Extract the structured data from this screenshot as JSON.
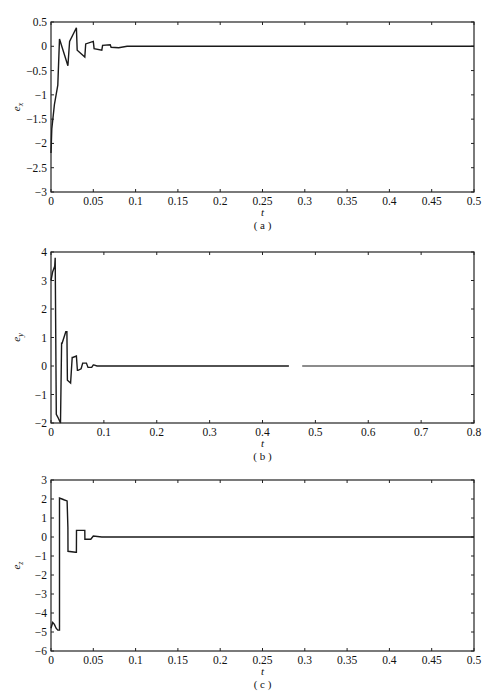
{
  "chart_data": [
    {
      "id": "a",
      "type": "line",
      "caption": "(a)",
      "xlabel": "t",
      "ylabel": "e_x",
      "ylabel_main": "e",
      "ylabel_sub": "x",
      "xlim": [
        0,
        0.5
      ],
      "ylim": [
        -3,
        0.5
      ],
      "xticks": [
        0,
        0.05,
        0.1,
        0.15,
        0.2,
        0.25,
        0.3,
        0.35,
        0.4,
        0.45,
        0.5
      ],
      "xtick_labels": [
        "0",
        "0.05",
        "0.1",
        "0.15",
        "0.2",
        "0.25",
        "0.3",
        "0.35",
        "0.4",
        "0.45",
        "0.5"
      ],
      "yticks": [
        -3,
        -2.5,
        -2,
        -1.5,
        -1,
        -0.5,
        0,
        0.5
      ],
      "ytick_labels": [
        "-3",
        "-2.5",
        "-2",
        "-1.5",
        "-1",
        "-0.5",
        "0",
        "0.5"
      ],
      "grid": false,
      "series": [
        {
          "name": "e_x",
          "x": [
            0,
            0.001,
            0.004,
            0.008,
            0.01,
            0.02,
            0.022,
            0.03,
            0.031,
            0.04,
            0.041,
            0.05,
            0.051,
            0.06,
            0.061,
            0.07,
            0.071,
            0.08,
            0.09,
            0.1,
            0.2,
            0.3,
            0.4,
            0.5
          ],
          "y": [
            -2.2,
            -1.7,
            -1.2,
            -0.8,
            0.15,
            -0.4,
            0.1,
            0.38,
            -0.08,
            -0.22,
            0.05,
            0.1,
            -0.05,
            -0.08,
            0.02,
            0.03,
            -0.02,
            -0.03,
            0.0,
            0.0,
            0.0,
            0.0,
            0.0,
            0.0
          ]
        }
      ]
    },
    {
      "id": "b",
      "type": "line",
      "caption": "(b)",
      "xlabel": "t",
      "ylabel": "e_y",
      "ylabel_main": "e",
      "ylabel_sub": "y",
      "xlim": [
        0,
        0.8
      ],
      "ylim": [
        -2,
        4
      ],
      "xticks": [
        0,
        0.1,
        0.2,
        0.3,
        0.4,
        0.5,
        0.6,
        0.7,
        0.8
      ],
      "xtick_labels": [
        "0",
        "0.1",
        "0.2",
        "0.3",
        "0.4",
        "0.5",
        "0.6",
        "0.7",
        "0.8"
      ],
      "yticks": [
        -2,
        -1,
        0,
        1,
        2,
        3,
        4
      ],
      "ytick_labels": [
        "-2",
        "-1",
        "0",
        "1",
        "2",
        "3",
        "4"
      ],
      "grid": false,
      "gap": [
        0.45,
        0.475
      ],
      "series": [
        {
          "name": "e_y",
          "x": [
            0,
            0.003,
            0.007,
            0.008,
            0.01,
            0.013,
            0.018,
            0.02,
            0.021,
            0.028,
            0.03,
            0.031,
            0.037,
            0.04,
            0.041,
            0.048,
            0.05,
            0.051,
            0.057,
            0.06,
            0.061,
            0.067,
            0.07,
            0.071,
            0.077,
            0.08,
            0.081,
            0.087,
            0.09,
            0.2,
            0.3,
            0.45
          ],
          "y": [
            3.0,
            3.3,
            3.5,
            3.8,
            -1.7,
            -1.8,
            -2.0,
            0.8,
            0.8,
            1.2,
            1.2,
            -0.5,
            -0.6,
            0.3,
            0.3,
            0.35,
            -0.15,
            -0.15,
            -0.1,
            0.1,
            0.1,
            0.1,
            -0.05,
            -0.05,
            -0.05,
            0.04,
            0.04,
            0.0,
            0.0,
            0.0,
            0.0,
            0.0
          ]
        },
        {
          "name": "e_y (cont.)",
          "x": [
            0.475,
            0.6,
            0.7,
            0.8
          ],
          "y": [
            0.0,
            0.0,
            0.0,
            0.0
          ]
        }
      ]
    },
    {
      "id": "c",
      "type": "line",
      "caption": "(c)",
      "xlabel": "t",
      "ylabel": "e_z",
      "ylabel_main": "e",
      "ylabel_sub": "z",
      "xlim": [
        0,
        0.5
      ],
      "ylim": [
        -6,
        3
      ],
      "xticks": [
        0,
        0.05,
        0.1,
        0.15,
        0.2,
        0.25,
        0.3,
        0.35,
        0.4,
        0.45,
        0.5
      ],
      "xtick_labels": [
        "0",
        "0.05",
        "0.1",
        "0.15",
        "0.2",
        "0.25",
        "0.3",
        "0.35",
        "0.4",
        "0.45",
        "0.5"
      ],
      "yticks": [
        -6,
        -5,
        -4,
        -3,
        -2,
        -1,
        0,
        1,
        2,
        3
      ],
      "ytick_labels": [
        "-6",
        "-5",
        "-4",
        "-3",
        "-2",
        "-1",
        "0",
        "1",
        "2",
        "3"
      ],
      "grid": false,
      "series": [
        {
          "name": "e_z",
          "x": [
            0,
            0.002,
            0.004,
            0.006,
            0.008,
            0.01,
            0.0101,
            0.013,
            0.016,
            0.019,
            0.02,
            0.0201,
            0.029,
            0.03,
            0.0301,
            0.039,
            0.04,
            0.0401,
            0.047,
            0.05,
            0.06,
            0.1,
            0.2,
            0.3,
            0.4,
            0.5
          ],
          "y": [
            -4.8,
            -4.5,
            -4.6,
            -4.8,
            -4.9,
            -4.9,
            2.05,
            2.0,
            1.95,
            1.9,
            0.5,
            -0.75,
            -0.8,
            -0.8,
            0.35,
            0.35,
            0.35,
            -0.12,
            -0.12,
            0.05,
            0.0,
            0.0,
            0.0,
            0.0,
            0.0,
            0.0
          ]
        }
      ]
    }
  ],
  "panels": [
    {
      "caption": "(a)",
      "xlabel": "t"
    },
    {
      "caption": "(b)",
      "xlabel": "t"
    },
    {
      "caption": "(c)",
      "xlabel": "t"
    }
  ]
}
